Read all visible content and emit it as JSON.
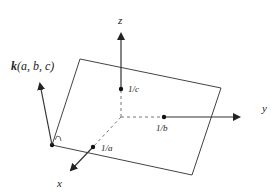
{
  "diagram": {
    "colors": {
      "line": "#333333",
      "dash": "#777777",
      "text": "#222222",
      "background": "#ffffff"
    },
    "axes": {
      "x": {
        "label": "x"
      },
      "y": {
        "label": "y"
      },
      "z": {
        "label": "z"
      }
    },
    "intercepts": {
      "a": {
        "label": "1/a"
      },
      "b": {
        "label": "1/b"
      },
      "c": {
        "label": "1/c"
      }
    },
    "normal_vector": {
      "label_bold": "k",
      "label_rest": "(a, b, c)"
    }
  }
}
